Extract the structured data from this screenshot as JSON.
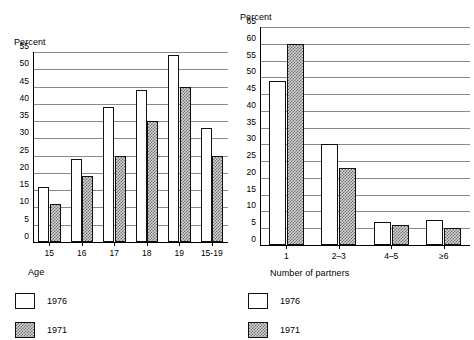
{
  "chart_data": [
    {
      "id": "age-chart",
      "type": "bar",
      "title": "",
      "xlabel": "Age",
      "ylabel": "Percent",
      "ylim": [
        0,
        55
      ],
      "ytick_step": 5,
      "yticks": [
        "0",
        "5",
        "10",
        "15",
        "20",
        "25",
        "30",
        "35",
        "40",
        "45",
        "50",
        "55"
      ],
      "grid": true,
      "legend_position": "below-left",
      "categories": [
        "15",
        "16",
        "17",
        "18",
        "19",
        "15-19"
      ],
      "series": [
        {
          "name": "1976",
          "values": [
            16,
            24,
            39,
            44,
            54,
            33
          ]
        },
        {
          "name": "1971",
          "values": [
            11,
            19,
            25,
            35,
            45,
            25
          ]
        }
      ]
    },
    {
      "id": "partners-chart",
      "type": "bar",
      "title": "",
      "xlabel": "Number of partners",
      "ylabel": "Percent",
      "ylim": [
        0,
        65
      ],
      "ytick_step": 5,
      "yticks": [
        "0",
        "5",
        "10",
        "15",
        "20",
        "25",
        "30",
        "35",
        "40",
        "45",
        "50",
        "55",
        "60",
        "65"
      ],
      "grid": true,
      "legend_position": "below-left",
      "categories": [
        "1",
        "2-3",
        "4-5",
        ">=6"
      ],
      "categories_display": [
        "1",
        "2–3",
        "4–5",
        "≥6"
      ],
      "series": [
        {
          "name": "1976",
          "values": [
            49,
            30,
            7,
            7.5
          ]
        },
        {
          "name": "1971",
          "values": [
            60,
            23,
            6,
            5
          ]
        }
      ]
    }
  ],
  "left": {
    "ylabel": "Percent",
    "xlabel": "Age",
    "yticks": [
      "55",
      "50",
      "45",
      "40",
      "35",
      "30",
      "25",
      "20",
      "15",
      "10",
      "5",
      "0"
    ],
    "xticks": [
      "15",
      "16",
      "17",
      "18",
      "19",
      "15–19"
    ],
    "legend": [
      {
        "key": "s1976",
        "label": "1976"
      },
      {
        "key": "s1971",
        "label": "1971"
      }
    ]
  },
  "right": {
    "ylabel": "Percent",
    "xlabel": "Number of partners",
    "yticks": [
      "65",
      "60",
      "55",
      "50",
      "45",
      "40",
      "35",
      "30",
      "25",
      "20",
      "15",
      "10",
      "5",
      "0"
    ],
    "xticks": [
      "1",
      "2–3",
      "4–5",
      "≥6"
    ],
    "legend": [
      {
        "key": "s1976",
        "label": "1976"
      },
      {
        "key": "s1971",
        "label": "1971"
      }
    ]
  },
  "colors": {
    "background": "#ffffff",
    "ink": "#000000",
    "gridline": "#8a8a8a",
    "series_1976_fill": "#ffffff",
    "series_1971_fill": "#d2d2d2",
    "series_1971_hatch": "#6f6f6f"
  }
}
